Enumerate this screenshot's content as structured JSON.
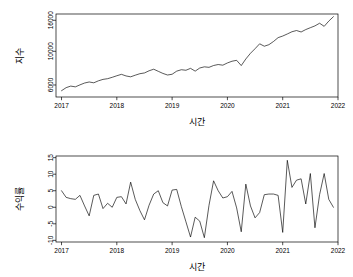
{
  "figure": {
    "background": "#ffffff",
    "line_color": "#000000",
    "panels": [
      "index",
      "return"
    ]
  },
  "chart_data": [
    {
      "type": "line",
      "id": "index",
      "title": "",
      "xlabel": "시간",
      "ylabel": "지수",
      "xlim": [
        2016.9,
        2022.0
      ],
      "ylim": [
        5000,
        17600
      ],
      "yscale": "log",
      "grid": false,
      "legend": null,
      "xticks": [
        2017,
        2018,
        2019,
        2020,
        2021,
        2022
      ],
      "xticklabels": [
        "2017",
        "2018",
        "2019",
        "2020",
        "2021",
        "2022"
      ],
      "yticks": [
        6000,
        10000,
        16000
      ],
      "yticklabels": [
        "6000",
        "10000",
        "16000"
      ],
      "x": [
        2017.0,
        2017.083,
        2017.167,
        2017.25,
        2017.333,
        2017.417,
        2017.5,
        2017.583,
        2017.667,
        2017.75,
        2017.833,
        2017.917,
        2018.0,
        2018.083,
        2018.167,
        2018.25,
        2018.333,
        2018.417,
        2018.5,
        2018.583,
        2018.667,
        2018.75,
        2018.833,
        2018.917,
        2019.0,
        2019.083,
        2019.167,
        2019.25,
        2019.333,
        2019.417,
        2019.5,
        2019.583,
        2019.667,
        2019.75,
        2019.833,
        2019.917,
        2020.0,
        2020.083,
        2020.167,
        2020.25,
        2020.333,
        2020.417,
        2020.5,
        2020.583,
        2020.667,
        2020.75,
        2020.833,
        2020.917,
        2021.0,
        2021.083,
        2021.167,
        2021.25,
        2021.333,
        2021.417,
        2021.5,
        2021.583,
        2021.667,
        2021.75,
        2021.833,
        2021.917
      ],
      "values": [
        5500,
        5760,
        5900,
        5830,
        6010,
        6180,
        6280,
        6200,
        6390,
        6530,
        6600,
        6740,
        6900,
        7050,
        6880,
        6790,
        6960,
        7120,
        7200,
        7440,
        7620,
        7380,
        7150,
        6980,
        7060,
        7400,
        7560,
        7500,
        7720,
        7400,
        7760,
        7900,
        7840,
        8060,
        8180,
        8100,
        8380,
        8600,
        8720,
        8050,
        8900,
        9700,
        10400,
        11200,
        10800,
        11050,
        11600,
        12300,
        12600,
        13000,
        13450,
        13700,
        13400,
        13900,
        14300,
        14700,
        15300,
        14600,
        15800,
        16900
      ]
    },
    {
      "type": "line",
      "id": "return",
      "title": "",
      "xlabel": "시간",
      "ylabel": "수익률",
      "xlim": [
        2016.9,
        2022.0
      ],
      "ylim": [
        -10.5,
        15.5
      ],
      "yscale": "linear",
      "grid": false,
      "legend": null,
      "xticks": [
        2017,
        2018,
        2019,
        2020,
        2021,
        2022
      ],
      "xticklabels": [
        "2017",
        "2018",
        "2019",
        "2020",
        "2021",
        "2022"
      ],
      "yticks": [
        -10,
        -5,
        0,
        5,
        10,
        15
      ],
      "yticklabels": [
        "-10",
        "-5",
        "0",
        "5",
        "10",
        "15"
      ],
      "x": [
        2017.0,
        2017.083,
        2017.167,
        2017.25,
        2017.333,
        2017.417,
        2017.5,
        2017.583,
        2017.667,
        2017.75,
        2017.833,
        2017.917,
        2018.0,
        2018.083,
        2018.167,
        2018.25,
        2018.333,
        2018.417,
        2018.5,
        2018.583,
        2018.667,
        2018.75,
        2018.833,
        2018.917,
        2019.0,
        2019.083,
        2019.167,
        2019.25,
        2019.333,
        2019.417,
        2019.5,
        2019.583,
        2019.667,
        2019.75,
        2019.833,
        2019.917,
        2020.0,
        2020.083,
        2020.167,
        2020.25,
        2020.333,
        2020.417,
        2020.5,
        2020.583,
        2020.667,
        2020.75,
        2020.833,
        2020.917,
        2021.0,
        2021.083,
        2021.167,
        2021.25,
        2021.333,
        2021.417,
        2021.5,
        2021.583,
        2021.667,
        2021.75,
        2021.833,
        2021.917
      ],
      "values": [
        5.0,
        3.0,
        2.6,
        2.4,
        3.6,
        0.4,
        -2.6,
        3.6,
        4.0,
        -0.4,
        1.2,
        0.0,
        3.0,
        3.2,
        1.0,
        7.6,
        2.4,
        -1.0,
        -3.8,
        0.6,
        4.0,
        5.0,
        1.4,
        0.4,
        5.2,
        5.4,
        0.2,
        -4.4,
        -9.0,
        -3.0,
        -4.2,
        -9.2,
        0.6,
        8.0,
        5.0,
        2.8,
        3.2,
        4.8,
        -0.2,
        -7.4,
        7.0,
        0.4,
        -3.2,
        -1.6,
        3.8,
        4.0,
        4.0,
        3.6,
        -7.6,
        14.2,
        6.0,
        8.2,
        8.6,
        1.0,
        10.2,
        -6.2,
        3.8,
        10.2,
        2.4,
        0.0
      ]
    }
  ],
  "panel_index": {
    "ylabel": "지수",
    "xlabel": "시간"
  },
  "panel_return": {
    "ylabel": "수익률",
    "xlabel": "시간"
  }
}
